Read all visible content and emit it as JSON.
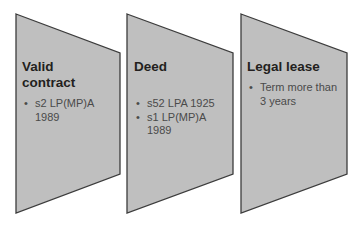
{
  "diagram": {
    "fill_color": "#bfbfbf",
    "stroke_color": "#3c3c3c",
    "steps": [
      {
        "title_lines": [
          "Valid",
          "contract"
        ],
        "bullets": [
          [
            "s2 LP(MP)A",
            "1989"
          ]
        ]
      },
      {
        "title_lines": [
          "Deed"
        ],
        "bullets": [
          [
            "s52 LPA 1925"
          ],
          [
            "s1 LP(MP)A",
            "1989"
          ]
        ]
      },
      {
        "title_lines": [
          "Legal lease"
        ],
        "bullets": [
          [
            "Term more than",
            "3 years"
          ]
        ]
      }
    ]
  }
}
